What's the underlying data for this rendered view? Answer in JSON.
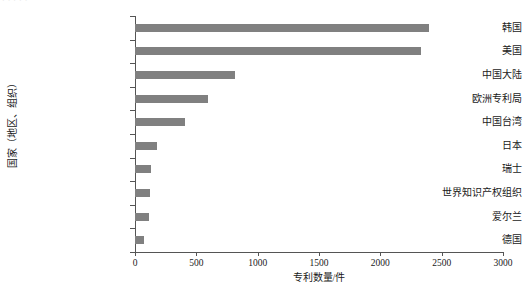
{
  "figure": {
    "clipped_caption_fragment": "· · ·  · ·",
    "bar_color": "#808080",
    "axis_color": "#555555"
  },
  "chart_data": {
    "type": "bar",
    "orientation": "horizontal",
    "title": "",
    "xlabel": "专利数量/件",
    "ylabel": "国家（地区、组织）",
    "categories": [
      "韩国",
      "美国",
      "中国大陆",
      "欧洲专利局",
      "中国台湾",
      "日本",
      "瑞士",
      "世界知识产权组织",
      "爱尔兰",
      "德国"
    ],
    "values": [
      2400,
      2330,
      815,
      595,
      405,
      180,
      130,
      120,
      115,
      75
    ],
    "xlim": [
      0,
      3000
    ],
    "xticks": [
      0,
      500,
      1000,
      1500,
      2000,
      2500,
      3000
    ],
    "xtick_labels": [
      "0",
      "500",
      "1000",
      "1500",
      "2000",
      "2500",
      "3000"
    ],
    "grid": false,
    "legend": false
  }
}
